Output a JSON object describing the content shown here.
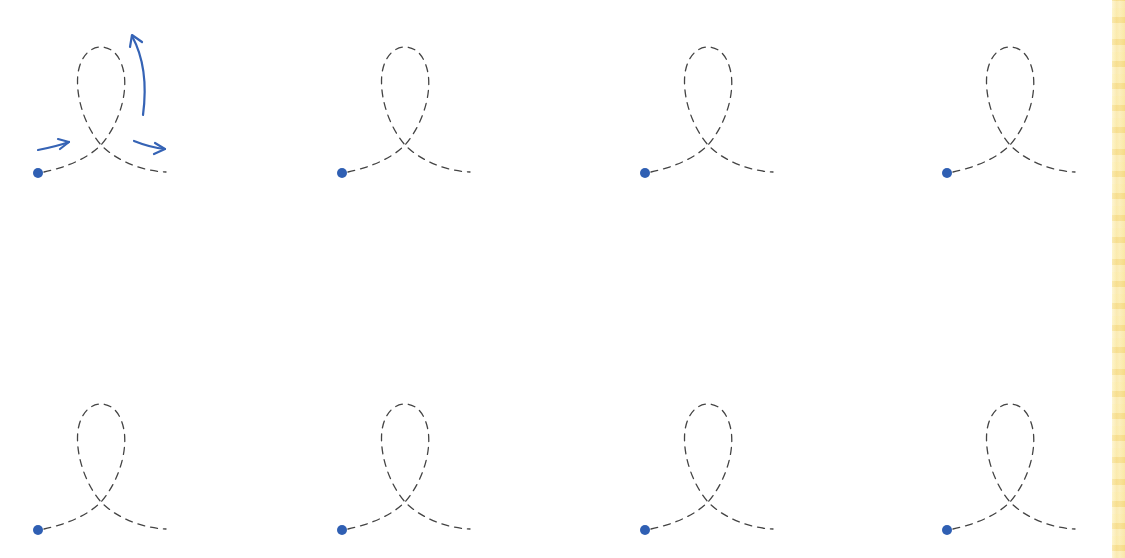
{
  "worksheet": {
    "type": "loop tracing practice",
    "colors": {
      "start_dot": "#2f5fb3",
      "guide_arrows": "#3563b5",
      "dashed_path": "#444444",
      "edge_strip": "#f9e49a"
    },
    "shapes": [
      {
        "row": 1,
        "col": 1,
        "start": [
          38,
          173
        ],
        "has_guide_arrows": true
      },
      {
        "row": 1,
        "col": 2,
        "start": [
          342,
          173
        ],
        "has_guide_arrows": false
      },
      {
        "row": 1,
        "col": 3,
        "start": [
          645,
          173
        ],
        "has_guide_arrows": false
      },
      {
        "row": 1,
        "col": 4,
        "start": [
          947,
          173
        ],
        "has_guide_arrows": false
      },
      {
        "row": 2,
        "col": 1,
        "start": [
          38,
          530
        ],
        "has_guide_arrows": false
      },
      {
        "row": 2,
        "col": 2,
        "start": [
          342,
          530
        ],
        "has_guide_arrows": false
      },
      {
        "row": 2,
        "col": 3,
        "start": [
          645,
          530
        ],
        "has_guide_arrows": false
      },
      {
        "row": 2,
        "col": 4,
        "start": [
          947,
          530
        ],
        "has_guide_arrows": false
      }
    ],
    "guide_arrows": [
      {
        "name": "entry-arrow",
        "direction": "right-up"
      },
      {
        "name": "loop-arrow",
        "direction": "up"
      },
      {
        "name": "exit-arrow",
        "direction": "right-down"
      }
    ]
  }
}
